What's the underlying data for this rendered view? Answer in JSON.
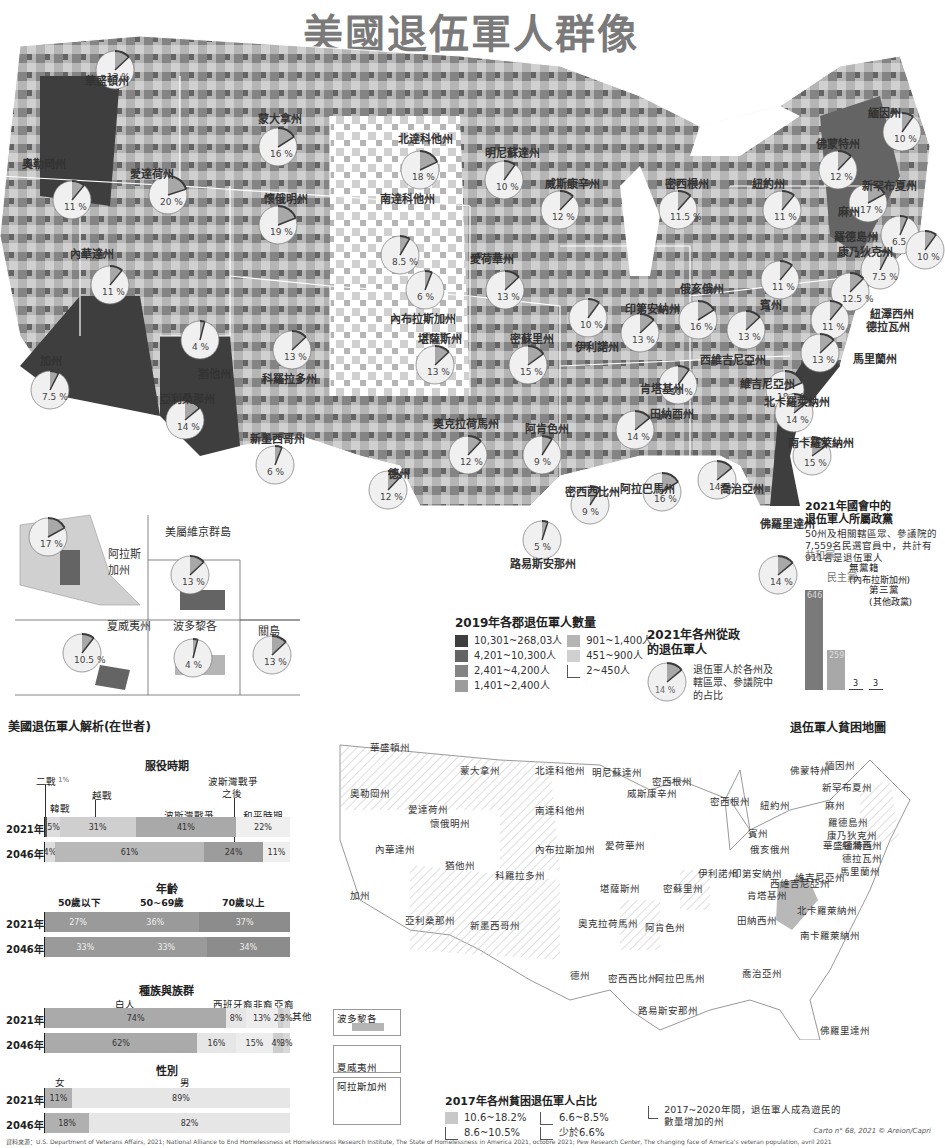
{
  "title": "美國退伍軍人群像",
  "colors": {
    "c1": "#3e3e3e",
    "c2": "#646464",
    "c3": "#848484",
    "c4": "#9c9c9c",
    "c5": "#b5b5b5",
    "c6": "#d0d0d0",
    "c7": "#ececec",
    "pie_slice": "#a8a8a8",
    "pie_rim": "#3a3a3a"
  },
  "county_legend": {
    "title": "2019年各郡退伍軍人數量",
    "items": [
      {
        "label": "10,301~268,03人",
        "color": "#3e3e3e"
      },
      {
        "label": "4,201~10,300人",
        "color": "#646464"
      },
      {
        "label": "2,401~4,200人",
        "color": "#848484"
      },
      {
        "label": "1,401~2,400人",
        "color": "#9c9c9c"
      },
      {
        "label": "901~1,400人",
        "color": "#b5b5b5"
      },
      {
        "label": "451~900人",
        "color": "#d0d0d0"
      },
      {
        "label": "2~450人",
        "color": ""
      }
    ]
  },
  "politics_legend": {
    "title": "2021年各州從政的退伍軍人",
    "example_pct": "14 %",
    "example_value": 14,
    "desc": "退伍軍人於各州及轄區眾、參議院中的占比"
  },
  "congress": {
    "title_line1": "2021年國會中的",
    "title_line2": "退伍軍人所屬政黨",
    "desc": "50州及相關轄區眾、參議院的7,559名民選官員中，共計有911名是退伍軍人",
    "parties": [
      {
        "name": "共和黨",
        "value": 646,
        "label": "646"
      },
      {
        "name": "民主黨",
        "value": 259,
        "label": "259"
      },
      {
        "name": "無黨籍",
        "sub": "(內布拉斯加州)",
        "value": 3,
        "label": "3"
      },
      {
        "name": "第三黨",
        "sub": "(其他政黨)",
        "value": 3,
        "label": "3"
      }
    ]
  },
  "states": [
    {
      "name": "華盛頓州",
      "pct": "13 %",
      "value": 13
    },
    {
      "name": "奧勒岡州",
      "pct": "11 %",
      "value": 11
    },
    {
      "name": "愛達荷州",
      "pct": "20 %",
      "value": 20
    },
    {
      "name": "蒙大拿州",
      "pct": "16 %",
      "value": 16
    },
    {
      "name": "北達科他州",
      "pct": "18 %",
      "value": 18
    },
    {
      "name": "明尼蘇達州",
      "pct": "10 %",
      "value": 10
    },
    {
      "name": "南達科他州",
      "pct": "8.5 %",
      "value": 8.5
    },
    {
      "name": "懷俄明州",
      "pct": "19 %",
      "value": 19
    },
    {
      "name": "威斯康辛州",
      "pct": "12 %",
      "value": 12
    },
    {
      "name": "密西根州",
      "pct": "11.5 %",
      "value": 11.5
    },
    {
      "name": "內華達州",
      "pct": "11 %",
      "value": 11
    },
    {
      "name": "內布拉斯加州",
      "pct": "6 %",
      "value": 6
    },
    {
      "name": "愛荷華州",
      "pct": "13 %",
      "value": 13
    },
    {
      "name": "猶他州",
      "pct": "4 %",
      "value": 4
    },
    {
      "name": "科羅拉多州",
      "pct": "13 %",
      "value": 13
    },
    {
      "name": "加州",
      "pct": "7.5 %",
      "value": 7.5
    },
    {
      "name": "堪薩斯州",
      "pct": "13 %",
      "value": 13
    },
    {
      "name": "密蘇里州",
      "pct": "15 %",
      "value": 15
    },
    {
      "name": "伊利諾州",
      "pct": "10 %",
      "value": 10
    },
    {
      "name": "印第安納州",
      "pct": "13 %",
      "value": 13
    },
    {
      "name": "俄亥俄州",
      "pct": "16 %",
      "value": 16
    },
    {
      "name": "賓州",
      "pct": "11 %",
      "value": 11
    },
    {
      "name": "紐約州",
      "pct": "11 %",
      "value": 11
    },
    {
      "name": "佛蒙特州",
      "pct": "12 %",
      "value": 12
    },
    {
      "name": "緬因州",
      "pct": "10 %",
      "value": 10
    },
    {
      "name": "新罕布夏州",
      "pct": "17 %",
      "value": 17
    },
    {
      "name": "麻州",
      "pct": "6.5 %",
      "value": 6.5
    },
    {
      "name": "羅德島州",
      "pct": "10 %",
      "value": 10
    },
    {
      "name": "康乃狄克州",
      "pct": "7.5 %",
      "value": 7.5
    },
    {
      "name": "紐澤西州",
      "pct": "12.5 %",
      "value": 12.5
    },
    {
      "name": "德拉瓦州",
      "pct": "11 %",
      "value": 11
    },
    {
      "name": "馬里蘭州",
      "pct": "13 %",
      "value": 13
    },
    {
      "name": "西維吉尼亞州",
      "pct": "13 %",
      "value": 13
    },
    {
      "name": "維吉尼亞州",
      "pct": "18.5 %",
      "value": 18.5
    },
    {
      "name": "肯塔基州",
      "pct": "10 %",
      "value": 10
    },
    {
      "name": "北卡羅萊納州",
      "pct": "14 %",
      "value": 14
    },
    {
      "name": "田納西州",
      "pct": "14 %",
      "value": 14
    },
    {
      "name": "南卡羅萊納州",
      "pct": "15 %",
      "value": 15
    },
    {
      "name": "亞利桑那州",
      "pct": "14 %",
      "value": 14
    },
    {
      "name": "新墨西哥州",
      "pct": "6 %",
      "value": 6
    },
    {
      "name": "奧克拉荷馬州",
      "pct": "12 %",
      "value": 12
    },
    {
      "name": "阿肯色州",
      "pct": "9 %",
      "value": 9
    },
    {
      "name": "德州",
      "pct": "12 %",
      "value": 12
    },
    {
      "name": "密西西比州",
      "pct": "9 %",
      "value": 9
    },
    {
      "name": "阿拉巴馬州",
      "pct": "16 %",
      "value": 16
    },
    {
      "name": "喬治亞州",
      "pct": "14 %",
      "value": 14
    },
    {
      "name": "路易斯安那州",
      "pct": "5 %",
      "value": 5
    },
    {
      "name": "佛羅里達州",
      "pct": "14 %",
      "value": 14
    }
  ],
  "territories": [
    {
      "name": "阿拉斯加州",
      "pct": "17 %",
      "value": 17
    },
    {
      "name": "美屬維京群島",
      "pct": "13 %",
      "value": 13
    },
    {
      "name": "夏威夷州",
      "pct": "10.5 %",
      "value": 10.5
    },
    {
      "name": "波多黎各",
      "pct": "4 %",
      "value": 4
    },
    {
      "name": "關島",
      "pct": "13 %",
      "value": 13
    }
  ],
  "analysis": {
    "title": "美國退伍軍人解析(在世者)",
    "service": {
      "title": "服役時期",
      "rows": [
        {
          "year": "2021年",
          "segments": [
            {
              "name": "二戰",
              "value": 1,
              "label": ""
            },
            {
              "name": "韓戰",
              "value": 5,
              "label": "5%"
            },
            {
              "name": "越戰",
              "value": 31,
              "label": "31%"
            },
            {
              "name": "波斯灣戰爭",
              "value": 41,
              "label": "41%"
            },
            {
              "name": "和平時期",
              "value": 22,
              "label": "22%"
            }
          ]
        },
        {
          "year": "2046年",
          "segments": [
            {
              "name": "越戰",
              "value": 4,
              "label": "4%"
            },
            {
              "name": "波斯灣戰爭",
              "value": 61,
              "label": "61%"
            },
            {
              "name": "波斯灣戰爭之後",
              "value": 24,
              "label": "24%"
            },
            {
              "name": "和平時期",
              "value": 11,
              "label": "11%"
            }
          ]
        }
      ],
      "labels": {
        "ww2": "二戰",
        "ww2_pct": "1%",
        "korea": "韓戰",
        "vietnam": "越戰",
        "post_gulf_1": "波斯灣戰爭",
        "post_gulf_2": "之後",
        "gulf": "波斯灣戰爭",
        "peace": "和平時期"
      }
    },
    "age": {
      "title": "年齡",
      "categories": [
        "50歲以下",
        "50~69歲",
        "70歲以上"
      ],
      "rows": [
        {
          "year": "2021年",
          "values": [
            27,
            36,
            37
          ],
          "labels": [
            "27%",
            "36%",
            "37%"
          ]
        },
        {
          "year": "2046年",
          "values": [
            33,
            33,
            34
          ],
          "labels": [
            "33%",
            "33%",
            "34%"
          ]
        }
      ]
    },
    "race": {
      "title": "種族與族群",
      "categories": [
        "白人",
        "西班牙裔",
        "非裔",
        "亞裔",
        "其他"
      ],
      "rows": [
        {
          "year": "2021年",
          "values": [
            74,
            8,
            13,
            2,
            3
          ],
          "labels": [
            "74%",
            "8%",
            "13%",
            "2%",
            "3%"
          ]
        },
        {
          "year": "2046年",
          "values": [
            62,
            16,
            15,
            4,
            3
          ],
          "labels": [
            "62%",
            "16%",
            "15%",
            "4%",
            "3%"
          ]
        }
      ]
    },
    "gender": {
      "title": "性別",
      "categories": [
        "女",
        "男"
      ],
      "rows": [
        {
          "year": "2021年",
          "values": [
            11,
            89
          ],
          "labels": [
            "11%",
            "89%"
          ]
        },
        {
          "year": "2046年",
          "values": [
            18,
            82
          ],
          "labels": [
            "18%",
            "82%"
          ]
        }
      ]
    }
  },
  "poverty": {
    "title": "退伍軍人貧困地圖",
    "legend_title": "2017年各州貧困退伍軍人占比",
    "legend": [
      {
        "label": "10.6~18.2%",
        "style": "gray"
      },
      {
        "label": "8.6~10.5%",
        "style": "empty"
      },
      {
        "label": "6.6~8.5%",
        "style": "empty"
      },
      {
        "label": "少於6.6%",
        "style": "empty"
      }
    ],
    "hatch_note": "2017~2020年間，退伍軍人成為遊民的數量增加的州",
    "insets": [
      "波多黎各",
      "夏威夷州",
      "阿拉斯加州"
    ],
    "labels": [
      "華盛頓州",
      "蒙大拿州",
      "北達科他州",
      "明尼蘇達州",
      "密西根州",
      "奧勒岡州",
      "愛達荷州",
      "南達科他州",
      "威斯康辛州",
      "密西根州",
      "懷俄明州",
      "內華達州",
      "內布拉斯加州",
      "愛荷華州",
      "猶他州",
      "科羅拉多州",
      "加州",
      "堪薩斯州",
      "密蘇里州",
      "伊利諾州",
      "印第安納州",
      "俄亥俄州",
      "西維吉尼亞州",
      "肯塔基州",
      "亞利桑那州",
      "新墨西哥州",
      "奧克拉荷馬州",
      "阿肯色州",
      "田納西州",
      "北卡羅萊納州",
      "南卡羅萊納州",
      "德州",
      "密西西比州",
      "阿拉巴馬州",
      "喬治亞州",
      "路易斯安那州",
      "佛羅里達州",
      "緬因州",
      "佛蒙特州",
      "新罕布夏州",
      "麻州",
      "紐約州",
      "羅德島州",
      "康乃狄克州",
      "賓州",
      "華盛頓特區",
      "紐澤西州",
      "德拉瓦州",
      "馬里蘭州",
      "維吉尼亞州"
    ]
  },
  "source": "資料來源：U.S. Department of Veterans Affairs, 2021; National Alliance to End Homelessness et Homelessness Research Institute, The State of Homelessness in America 2021, octobre 2021; Pew Research Center, The changing face of America's veteran population, avril 2021",
  "credit": "Carto n° 68, 2021 © Areion/Capri"
}
